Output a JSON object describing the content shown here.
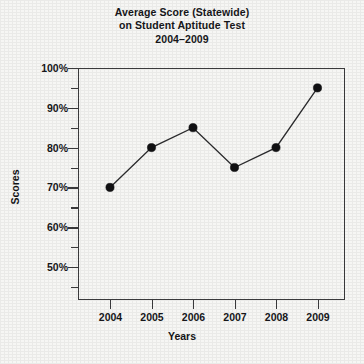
{
  "chart_data": {
    "type": "line",
    "title": "Average Score (Statewide)\non Student Aptitude Test\n2004–2009",
    "title_lines": [
      "Average Score (Statewide)",
      "on Student Aptitude Test",
      "2004–2009"
    ],
    "xlabel": "Years",
    "ylabel": "Scores",
    "categories": [
      "2004",
      "2005",
      "2006",
      "2007",
      "2008",
      "2009"
    ],
    "x": [
      2004,
      2005,
      2006,
      2007,
      2008,
      2009
    ],
    "values": [
      70,
      80,
      85,
      75,
      80,
      95
    ],
    "point_labels": [
      "70%",
      "80%",
      "85%",
      "75%",
      "80%",
      "95%"
    ],
    "ylim": [
      45,
      100
    ],
    "ytick_major": [
      50,
      60,
      70,
      80,
      90,
      100
    ],
    "ytick_labels": [
      "50%",
      "60%",
      "70%",
      "80%",
      "90%",
      "100%"
    ],
    "ytick_minor": [
      45,
      55,
      65,
      75,
      85,
      95
    ],
    "grid": false,
    "legend": null,
    "marker": "filled-circle",
    "line_color": "#2b2b2d",
    "marker_color": "#111113",
    "axis_color": "#3a3a3c",
    "background_color": "#f6f6f4"
  }
}
